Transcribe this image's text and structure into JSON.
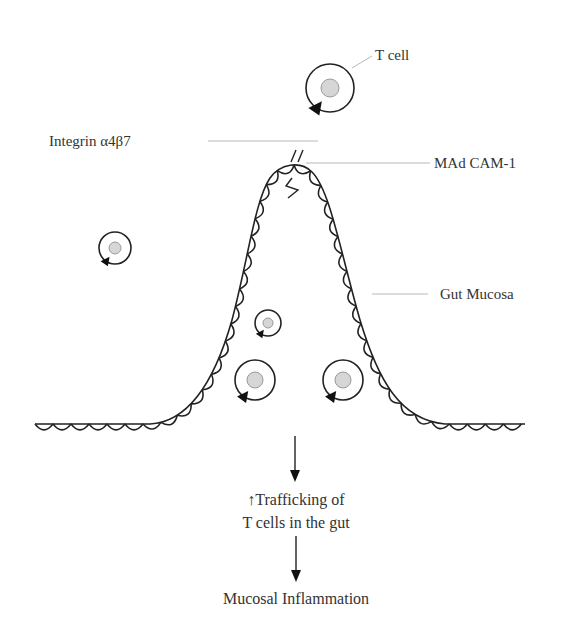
{
  "diagram": {
    "labels": {
      "t_cell": "T cell",
      "integrin": "Integrin α4β7",
      "madcam": "MAd CAM-1",
      "gut_mucosa": "Gut Mucosa"
    },
    "flow": {
      "step1_line1": "↑Trafficking of",
      "step1_line2": "T cells in the gut",
      "step2": "Mucosal Inflammation"
    },
    "cells": [
      {
        "id": "t-cell-top",
        "cx": 330,
        "cy": 88,
        "r": 24
      },
      {
        "id": "t-cell-left",
        "cx": 115,
        "cy": 248,
        "r": 16
      },
      {
        "id": "t-cell-small-center",
        "cx": 268,
        "cy": 323,
        "r": 13
      },
      {
        "id": "t-cell-bottom-left",
        "cx": 255,
        "cy": 380,
        "r": 20
      },
      {
        "id": "t-cell-bottom-right",
        "cx": 343,
        "cy": 380,
        "r": 20
      }
    ],
    "colors": {
      "line": "#222222",
      "nucleus_fill": "#d6d6d6",
      "leader": "#b8b8b8",
      "text": "#333333"
    }
  }
}
